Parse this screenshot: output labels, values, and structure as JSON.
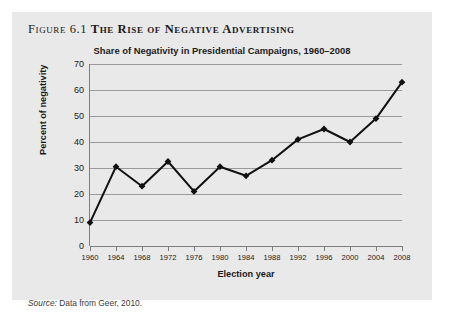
{
  "figure": {
    "number_label": "Figure 6.1",
    "heading": "The Rise of Negative Advertising",
    "source_label": "Source:",
    "source_text": "Data from Geer, 2010.",
    "background_color": "#e9e9e9",
    "line_color": "#111111",
    "gridline_color": "#9a9a9a"
  },
  "chart_data": {
    "type": "line",
    "title": "Share of Negativity in Presidential Campaigns, 1960–2008",
    "xlabel": "Election year",
    "ylabel": "Percent of negativity",
    "categories": [
      "1960",
      "1964",
      "1968",
      "1972",
      "1976",
      "1980",
      "1984",
      "1988",
      "1992",
      "1996",
      "2000",
      "2004",
      "2008"
    ],
    "values": [
      9,
      30.5,
      23,
      32.5,
      21,
      30.5,
      27,
      33,
      41,
      45,
      40,
      49,
      63
    ],
    "ylim": [
      0,
      70
    ],
    "yticks": [
      0,
      10,
      20,
      30,
      40,
      50,
      60,
      70
    ],
    "ytick_labels": [
      "0",
      "10",
      "20",
      "30",
      "40",
      "50",
      "60",
      "70"
    ],
    "grid": true,
    "legend": false,
    "marker": "diamond",
    "series": [
      {
        "name": "Percent of negativity",
        "values": [
          9,
          30.5,
          23,
          32.5,
          21,
          30.5,
          27,
          33,
          41,
          45,
          40,
          49,
          63
        ]
      }
    ]
  }
}
